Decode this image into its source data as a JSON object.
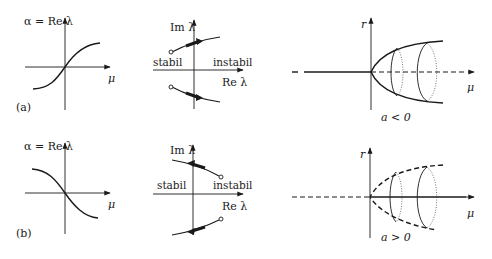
{
  "figure": {
    "rows": [
      {
        "label": "(a)",
        "re_lambda_plot": {
          "y_label": "α = Re λ",
          "x_label": "μ",
          "trend": "increasing"
        },
        "eigenvalue_plot": {
          "y_label": "Im λ",
          "x_label": "Re λ",
          "left_region": "stabil",
          "right_region": "instabil",
          "direction": "left-to-right"
        },
        "bifurcation_plot": {
          "y_label": "r",
          "x_label": "μ",
          "condition": "a < 0",
          "type": "supercritical"
        }
      },
      {
        "label": "(b)",
        "re_lambda_plot": {
          "y_label": "α = Re λ",
          "x_label": "μ",
          "trend": "decreasing"
        },
        "eigenvalue_plot": {
          "y_label": "Im λ",
          "x_label": "Re λ",
          "left_region": "stabil",
          "right_region": "instabil",
          "direction": "right-to-left"
        },
        "bifurcation_plot": {
          "y_label": "r",
          "x_label": "μ",
          "condition": "a > 0",
          "type": "subcritical"
        }
      }
    ],
    "colors": {
      "ink": "#1a1a1a",
      "background": "#ffffff"
    }
  }
}
